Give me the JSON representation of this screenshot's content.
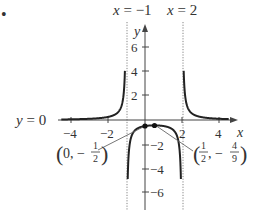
{
  "bullet": "•",
  "chart_data": {
    "type": "line",
    "function": "f(x) = 1 / ((x + 1)(x - 2))",
    "title": "",
    "xlabel": "x",
    "ylabel": "y",
    "xlim": [
      -4.5,
      4.5
    ],
    "ylim": [
      -7,
      7
    ],
    "x_ticks": [
      -4,
      -2,
      2,
      4
    ],
    "x_tick_labels": [
      "−4",
      "−2",
      "2",
      "4"
    ],
    "y_ticks": [
      6,
      4,
      2,
      -2,
      -4,
      -6
    ],
    "y_tick_labels": [
      "6",
      "4",
      "2",
      "−2",
      "−4",
      "−6"
    ],
    "grid": false,
    "asymptotes": {
      "vertical": [
        {
          "x": -1,
          "label": "x = −1"
        },
        {
          "x": 2,
          "label": "x = 2"
        }
      ],
      "horizontal": [
        {
          "y": 0,
          "label": "y = 0"
        }
      ]
    },
    "points": [
      {
        "x": 0,
        "y": -0.5,
        "label": "(0, −1/2)"
      },
      {
        "x": 0.5,
        "y": -0.4444,
        "label": "(1/2, −4/9)"
      }
    ],
    "series": [
      {
        "name": "left branch",
        "x_range": [
          -4.5,
          -1.08
        ]
      },
      {
        "name": "middle branch",
        "x_range": [
          -0.93,
          1.93
        ]
      },
      {
        "name": "right branch",
        "x_range": [
          2.08,
          4.5
        ]
      }
    ]
  },
  "labels": {
    "asym_left": "x = −1",
    "asym_right": "x = 2",
    "asym_horizontal": "y = 0",
    "x_axis": "x",
    "y_axis": "y",
    "point1_label": {
      "prefix": "0, −",
      "num": "1",
      "den": "2"
    },
    "point2_label": {
      "prefix_num": "1",
      "prefix_den": "2",
      "mid": ", −",
      "num": "4",
      "den": "9"
    }
  }
}
